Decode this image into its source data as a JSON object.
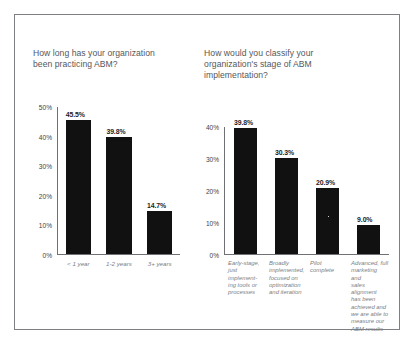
{
  "figure": {
    "background_color": "#ffffff",
    "border_color": "#7d7f83",
    "bar_color": "#111111",
    "title_color": "#54585c",
    "axis_color": "#6f7175",
    "xlabel_color": "#7b7e82"
  },
  "chart_data": [
    {
      "type": "bar",
      "id": "abm-tenure",
      "title": "How long has your organization\nbeen practicing ABM?",
      "xlabel": "",
      "ylabel": "",
      "ylim": [
        0,
        50
      ],
      "grid": false,
      "legend": false,
      "categories": [
        "< 1 year",
        "1-2 years",
        "3+ years"
      ],
      "values": [
        45.5,
        39.8,
        14.7
      ],
      "value_labels": [
        "45.5%",
        "39.8%",
        "14.7%"
      ],
      "yticks": [
        50,
        40,
        30,
        20,
        10,
        0
      ],
      "ytick_labels": [
        "50%",
        "40%",
        "30%",
        "20%",
        "10%",
        "0%"
      ]
    },
    {
      "type": "bar",
      "id": "abm-stage",
      "title": "How would you classify your\norganization's stage of ABM\nimplementation?",
      "xlabel": "",
      "ylabel": "",
      "ylim": [
        0,
        40
      ],
      "grid": false,
      "legend": false,
      "categories": [
        "Early-stage,\njust implement-\ning tools or\nprocesses",
        "Broadly\nimplemented,\nfocused on\noptimization\nand iteration",
        "Pilot\ncomplete",
        "Advanced, full\nmarketing and\nsales alignment\nhas been\nachieved and\nwe are able to\nmeasure our\nABM results"
      ],
      "values": [
        39.8,
        30.3,
        20.9,
        9.0
      ],
      "value_labels": [
        "39.8%",
        "30.3%",
        "20.9%",
        "9.0%"
      ],
      "yticks": [
        40,
        30,
        20,
        10,
        0
      ],
      "ytick_labels": [
        "40%",
        "30%",
        "20%",
        "10%",
        "0%"
      ]
    }
  ]
}
